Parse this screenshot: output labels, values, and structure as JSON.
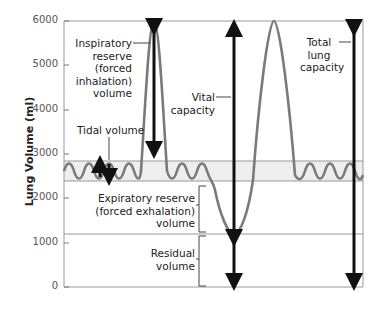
{
  "diagram": {
    "y_axis": {
      "label": "Lung Volume (ml)",
      "ticks": [
        "6000",
        "5000",
        "4000",
        "3000",
        "2000",
        "1000",
        "0"
      ]
    },
    "labels": {
      "inspiratory_reserve": [
        "Inspiratory",
        "reserve",
        "(forced",
        "inhalation)",
        "volume"
      ],
      "tidal_volume": "Tidal volume",
      "vital_capacity": [
        "Vital",
        "capacity"
      ],
      "total_lung_capacity": [
        "Total",
        "lung",
        "capacity"
      ],
      "expiratory_reserve": [
        "Expiratory reserve",
        "(forced exhalation)",
        "volume"
      ],
      "residual_volume": [
        "Residual",
        "volume"
      ]
    },
    "colors": {
      "curve": "#7a7a7a",
      "arrow": "#111111",
      "band": "#eeeeee",
      "frame": "#999999"
    }
  }
}
